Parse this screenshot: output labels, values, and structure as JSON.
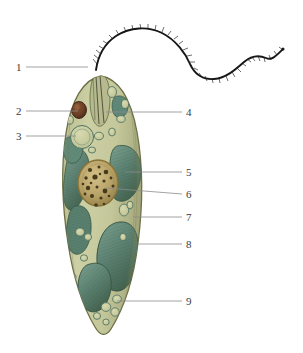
{
  "figure": {
    "media": "watercolour-and-ink illustration",
    "background_color": "#ffffff",
    "width": 303,
    "height": 353
  },
  "palette": {
    "cytoplasm": "#c4c79a",
    "cytoplasm_light": "#d2d4ac",
    "cytoplasm_shadow": "#aeb184",
    "membrane_outline": "#6d6f45",
    "chloroplast": "#5d8273",
    "chloroplast_dark": "#41604f",
    "chloroplast_light": "#7a9c8a",
    "nucleus": "#b9a469",
    "nucleus_rim": "#8a7438",
    "chromatin": "#473a1c",
    "eyespot": "#6b3f26",
    "eyespot_rim": "#4a2a17",
    "vacuole_outline": "#4f7464",
    "vacuole_fill": "#c8cb9f",
    "flagellum": "#171717",
    "leader_line": "#8c8c8c",
    "label_text": "#3a3a3a"
  },
  "labels": [
    {
      "id": "1",
      "text": "1",
      "side": "left",
      "x": 16,
      "y": 62,
      "line_from_x": 26,
      "line_to_x": 88,
      "line_y": 67
    },
    {
      "id": "2",
      "text": "2",
      "side": "left",
      "x": 16,
      "y": 106,
      "line_from_x": 26,
      "line_to_x": 78,
      "line_y": 111
    },
    {
      "id": "3",
      "text": "3",
      "side": "left",
      "x": 16,
      "y": 131,
      "line_from_x": 26,
      "line_to_x": 76,
      "line_y": 136
    },
    {
      "id": "4",
      "text": "4",
      "side": "right",
      "x": 186,
      "y": 107,
      "line_from_x": 182,
      "line_to_x": 106,
      "line_y": 112
    },
    {
      "id": "5",
      "text": "5",
      "side": "right",
      "x": 186,
      "y": 167,
      "line_from_x": 182,
      "line_to_x": 125,
      "line_y": 172
    },
    {
      "id": "6",
      "text": "6",
      "side": "right",
      "x": 186,
      "y": 189,
      "line_from_x": 182,
      "line_to_x": 106,
      "line_y": 194
    },
    {
      "id": "7",
      "text": "7",
      "side": "right",
      "x": 186,
      "y": 212,
      "line_from_x": 182,
      "line_to_x": 133,
      "line_y": 217
    },
    {
      "id": "8",
      "text": "8",
      "side": "right",
      "x": 186,
      "y": 239,
      "line_from_x": 182,
      "line_to_x": 138,
      "line_y": 244
    },
    {
      "id": "9",
      "text": "9",
      "side": "right",
      "x": 186,
      "y": 296,
      "line_from_x": 182,
      "line_to_x": 117,
      "line_y": 301
    }
  ],
  "structures": {
    "flagellum": {
      "name": "flagellum",
      "description": "long wavy anterior flagellum with fine lateral mastigonemes",
      "color": "#171717"
    },
    "eyespot": {
      "name": "eyespot-stigma",
      "description": "dark reddish-brown pigment spot near anterior end",
      "color": "#6b3f26"
    },
    "contractile_vacuole": {
      "name": "contractile-vacuole",
      "description": "large round clear vacuole in anterior cytoplasm",
      "color": "#c8cb9f"
    },
    "reservoir": {
      "name": "reservoir-gullet",
      "description": "elongate flask-shaped invagination at the anterior apex",
      "color": "#9aa377"
    },
    "chloroplast": {
      "name": "chloroplast",
      "description": "large striated teal-green plastids distributed through the cell",
      "color": "#5d8273"
    },
    "nucleus": {
      "name": "nucleus",
      "description": "central tan sphere speckled with dark chromatin granules",
      "color": "#b9a469"
    },
    "pellicle": {
      "name": "pellicle-membrane",
      "description": "outer striated proteinaceous envelope of the cell",
      "color": "#6d6f45"
    },
    "paramylon": {
      "name": "paramylon-granule",
      "description": "small oval storage bodies scattered in the cytoplasm",
      "color": "#c8cb9f"
    }
  }
}
